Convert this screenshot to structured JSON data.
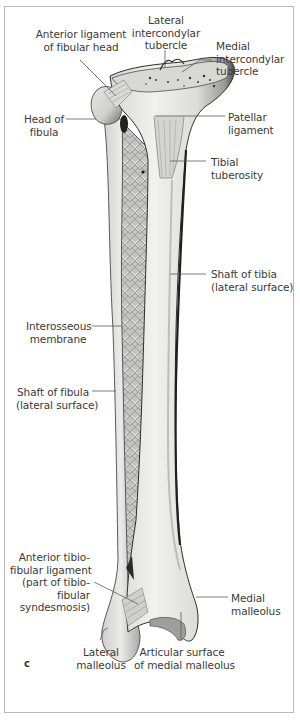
{
  "figure": {
    "panel_letter": "c",
    "colors": {
      "bone_light": "#ececea",
      "bone_mid": "#c9c9c6",
      "bone_shadow": "#7e7e7b",
      "outline": "#2a2a2a",
      "leader": "#5a5a5a",
      "frame": "#b8b8b8"
    }
  },
  "labels": {
    "anterior_ligament_fibular_head": {
      "line1": "Anterior ligament",
      "line2": "of fibular head"
    },
    "lateral_intercondylar_tubercle": {
      "line1": "Lateral",
      "line2": "intercondylar",
      "line3": "tubercle"
    },
    "medial_intercondylar_tubercle": {
      "line1": "Medial",
      "line2": "intercondylar",
      "line3": "tubercle"
    },
    "head_of_fibula": {
      "line1": "Head of",
      "line2": "fibula"
    },
    "patellar_ligament": {
      "line1": "Patellar",
      "line2": "ligament"
    },
    "tibial_tuberosity": {
      "line1": "Tibial",
      "line2": "tuberosity"
    },
    "shaft_of_tibia": {
      "line1": "Shaft of tibia",
      "line2": "(lateral surface)"
    },
    "interosseous_membrane": {
      "line1": "Interosseous",
      "line2": "membrane"
    },
    "shaft_of_fibula": {
      "line1": "Shaft of fibula",
      "line2": "(lateral surface)"
    },
    "anterior_tibiofibular_ligament": {
      "line1": "Anterior tibio-",
      "line2": "fibular ligament",
      "line3": "(part of tibio-",
      "line4": "fibular",
      "line5": "syndesmosis)"
    },
    "medial_malleolus": {
      "line1": "Medial",
      "line2": "malleolus"
    },
    "lateral_malleolus": {
      "line1": "Lateral",
      "line2": "malleolus"
    },
    "articular_surface_medial_malleolus": {
      "line1": "Articular surface",
      "line2": "of medial malleolus"
    }
  }
}
